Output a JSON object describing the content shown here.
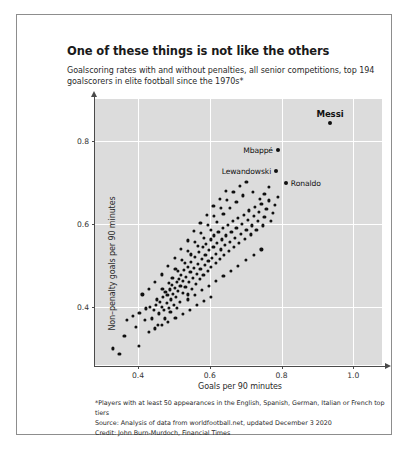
{
  "chart_data": {
    "type": "scatter",
    "title": "One of these things is not like the others",
    "subtitle": "Goalscoring rates with and without penalties, all senior competitions, top 194 goalscorers in elite football since the 1970s*",
    "xlabel": "Goals per 90 minutes",
    "ylabel": "Non–penalty goals per 90 minutes",
    "xlim": [
      0.28,
      1.08
    ],
    "ylim": [
      0.26,
      0.9
    ],
    "xticks": [
      0.4,
      0.6,
      0.8,
      1.0
    ],
    "xtick_labels": [
      "0.4",
      "0.6",
      "0.8",
      "1.0"
    ],
    "yticks": [
      0.4,
      0.6,
      0.8
    ],
    "ytick_labels": [
      "0.4",
      "0.6",
      "0.8"
    ],
    "grid": true,
    "legend": "none",
    "plot_background": "#dcdcdc",
    "point_color": "#101010",
    "annotations": [
      {
        "label": "Messi",
        "x": 0.935,
        "y": 0.843,
        "position": "above",
        "bold": true
      },
      {
        "label": "Mbappé",
        "x": 0.79,
        "y": 0.778,
        "position": "left",
        "bold": false
      },
      {
        "label": "Lewandowski",
        "x": 0.785,
        "y": 0.727,
        "position": "left",
        "bold": false
      },
      {
        "label": "Ronaldo",
        "x": 0.812,
        "y": 0.697,
        "position": "right",
        "bold": false
      }
    ],
    "points": [
      [
        0.935,
        0.843
      ],
      [
        0.79,
        0.778
      ],
      [
        0.785,
        0.727
      ],
      [
        0.812,
        0.697
      ],
      [
        0.33,
        0.3
      ],
      [
        0.348,
        0.286
      ],
      [
        0.362,
        0.33
      ],
      [
        0.395,
        0.352
      ],
      [
        0.402,
        0.306
      ],
      [
        0.42,
        0.368
      ],
      [
        0.432,
        0.4
      ],
      [
        0.438,
        0.372
      ],
      [
        0.444,
        0.392
      ],
      [
        0.45,
        0.404
      ],
      [
        0.452,
        0.418
      ],
      [
        0.458,
        0.384
      ],
      [
        0.462,
        0.412
      ],
      [
        0.466,
        0.4
      ],
      [
        0.47,
        0.424
      ],
      [
        0.472,
        0.392
      ],
      [
        0.476,
        0.436
      ],
      [
        0.48,
        0.41
      ],
      [
        0.482,
        0.428
      ],
      [
        0.486,
        0.398
      ],
      [
        0.488,
        0.442
      ],
      [
        0.492,
        0.418
      ],
      [
        0.494,
        0.452
      ],
      [
        0.498,
        0.432
      ],
      [
        0.5,
        0.404
      ],
      [
        0.502,
        0.446
      ],
      [
        0.506,
        0.424
      ],
      [
        0.508,
        0.46
      ],
      [
        0.51,
        0.438
      ],
      [
        0.514,
        0.468
      ],
      [
        0.516,
        0.412
      ],
      [
        0.518,
        0.45
      ],
      [
        0.52,
        0.476
      ],
      [
        0.524,
        0.434
      ],
      [
        0.526,
        0.462
      ],
      [
        0.528,
        0.488
      ],
      [
        0.532,
        0.448
      ],
      [
        0.534,
        0.472
      ],
      [
        0.538,
        0.43
      ],
      [
        0.54,
        0.496
      ],
      [
        0.542,
        0.46
      ],
      [
        0.546,
        0.484
      ],
      [
        0.548,
        0.508
      ],
      [
        0.55,
        0.444
      ],
      [
        0.554,
        0.47
      ],
      [
        0.556,
        0.494
      ],
      [
        0.558,
        0.52
      ],
      [
        0.562,
        0.456
      ],
      [
        0.564,
        0.48
      ],
      [
        0.566,
        0.504
      ],
      [
        0.57,
        0.532
      ],
      [
        0.572,
        0.468
      ],
      [
        0.574,
        0.492
      ],
      [
        0.578,
        0.516
      ],
      [
        0.58,
        0.544
      ],
      [
        0.582,
        0.476
      ],
      [
        0.586,
        0.5
      ],
      [
        0.588,
        0.524
      ],
      [
        0.59,
        0.552
      ],
      [
        0.594,
        0.486
      ],
      [
        0.596,
        0.51
      ],
      [
        0.598,
        0.536
      ],
      [
        0.602,
        0.562
      ],
      [
        0.604,
        0.496
      ],
      [
        0.606,
        0.518
      ],
      [
        0.61,
        0.544
      ],
      [
        0.612,
        0.572
      ],
      [
        0.616,
        0.506
      ],
      [
        0.618,
        0.528
      ],
      [
        0.62,
        0.554
      ],
      [
        0.624,
        0.58
      ],
      [
        0.628,
        0.516
      ],
      [
        0.63,
        0.538
      ],
      [
        0.634,
        0.562
      ],
      [
        0.636,
        0.59
      ],
      [
        0.64,
        0.524
      ],
      [
        0.642,
        0.548
      ],
      [
        0.646,
        0.572
      ],
      [
        0.65,
        0.598
      ],
      [
        0.654,
        0.534
      ],
      [
        0.656,
        0.556
      ],
      [
        0.66,
        0.58
      ],
      [
        0.664,
        0.606
      ],
      [
        0.668,
        0.544
      ],
      [
        0.67,
        0.566
      ],
      [
        0.674,
        0.59
      ],
      [
        0.678,
        0.614
      ],
      [
        0.682,
        0.554
      ],
      [
        0.686,
        0.576
      ],
      [
        0.69,
        0.6
      ],
      [
        0.694,
        0.622
      ],
      [
        0.698,
        0.564
      ],
      [
        0.702,
        0.586
      ],
      [
        0.706,
        0.61
      ],
      [
        0.71,
        0.632
      ],
      [
        0.714,
        0.574
      ],
      [
        0.718,
        0.596
      ],
      [
        0.722,
        0.618
      ],
      [
        0.726,
        0.64
      ],
      [
        0.73,
        0.586
      ],
      [
        0.734,
        0.606
      ],
      [
        0.738,
        0.628
      ],
      [
        0.744,
        0.648
      ],
      [
        0.748,
        0.596
      ],
      [
        0.752,
        0.616
      ],
      [
        0.758,
        0.636
      ],
      [
        0.764,
        0.656
      ],
      [
        0.77,
        0.606
      ],
      [
        0.776,
        0.626
      ],
      [
        0.782,
        0.646
      ],
      [
        0.79,
        0.664
      ],
      [
        0.43,
        0.34
      ],
      [
        0.448,
        0.348
      ],
      [
        0.466,
        0.356
      ],
      [
        0.484,
        0.364
      ],
      [
        0.504,
        0.374
      ],
      [
        0.524,
        0.382
      ],
      [
        0.544,
        0.392
      ],
      [
        0.564,
        0.404
      ],
      [
        0.584,
        0.414
      ],
      [
        0.604,
        0.424
      ],
      [
        0.496,
        0.47
      ],
      [
        0.512,
        0.486
      ],
      [
        0.53,
        0.506
      ],
      [
        0.548,
        0.526
      ],
      [
        0.566,
        0.546
      ],
      [
        0.584,
        0.566
      ],
      [
        0.602,
        0.586
      ],
      [
        0.62,
        0.604
      ],
      [
        0.638,
        0.624
      ],
      [
        0.656,
        0.638
      ],
      [
        0.674,
        0.652
      ],
      [
        0.692,
        0.668
      ],
      [
        0.54,
        0.418
      ],
      [
        0.558,
        0.428
      ],
      [
        0.578,
        0.44
      ],
      [
        0.598,
        0.45
      ],
      [
        0.618,
        0.462
      ],
      [
        0.638,
        0.474
      ],
      [
        0.658,
        0.486
      ],
      [
        0.678,
        0.498
      ],
      [
        0.7,
        0.512
      ],
      [
        0.722,
        0.524
      ],
      [
        0.744,
        0.538
      ],
      [
        0.456,
        0.356
      ],
      [
        0.474,
        0.372
      ],
      [
        0.49,
        0.388
      ],
      [
        0.508,
        0.398
      ],
      [
        0.468,
        0.444
      ],
      [
        0.486,
        0.458
      ],
      [
        0.504,
        0.492
      ],
      [
        0.522,
        0.512
      ],
      [
        0.54,
        0.534
      ],
      [
        0.558,
        0.556
      ],
      [
        0.576,
        0.578
      ],
      [
        0.594,
        0.598
      ],
      [
        0.612,
        0.618
      ],
      [
        0.63,
        0.638
      ],
      [
        0.648,
        0.658
      ],
      [
        0.666,
        0.676
      ],
      [
        0.684,
        0.69
      ],
      [
        0.702,
        0.7
      ],
      [
        0.72,
        0.676
      ],
      [
        0.74,
        0.66
      ],
      [
        0.368,
        0.368
      ],
      [
        0.386,
        0.378
      ],
      [
        0.404,
        0.386
      ],
      [
        0.422,
        0.396
      ],
      [
        0.412,
        0.43
      ],
      [
        0.43,
        0.444
      ],
      [
        0.448,
        0.46
      ],
      [
        0.466,
        0.478
      ],
      [
        0.484,
        0.498
      ],
      [
        0.502,
        0.518
      ],
      [
        0.52,
        0.54
      ],
      [
        0.538,
        0.56
      ],
      [
        0.556,
        0.582
      ],
      [
        0.574,
        0.602
      ],
      [
        0.592,
        0.622
      ],
      [
        0.61,
        0.642
      ],
      [
        0.628,
        0.66
      ],
      [
        0.646,
        0.678
      ],
      [
        0.752,
        0.672
      ],
      [
        0.764,
        0.688
      ]
    ]
  },
  "footnotes": {
    "line1": "*Players with at least 50 appearances in the English, Spanish, German, Italian or French top tiers",
    "line2": "Source: Analysis of data from worldfootball.net, updated December 3 2020",
    "line3": "Credit: John Burn-Murdoch, Financial Times"
  }
}
